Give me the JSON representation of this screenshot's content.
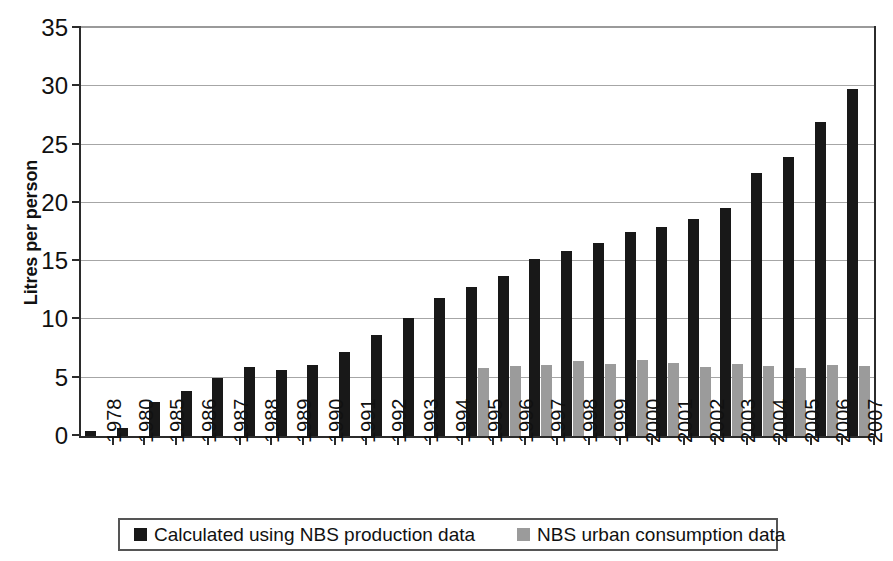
{
  "chart_data": {
    "type": "bar",
    "title": "",
    "xlabel": "",
    "ylabel": "Litres per person",
    "ylim": [
      0,
      35
    ],
    "ytick_values": [
      0,
      5,
      10,
      15,
      20,
      25,
      30,
      35
    ],
    "ytick_labels": [
      "0",
      "5",
      "10",
      "15",
      "20",
      "25",
      "30",
      "35"
    ],
    "grid": true,
    "legend_position": "bottom",
    "categories": [
      "1978",
      "1980",
      "1985",
      "1986",
      "1987",
      "1988",
      "1989",
      "1990",
      "1991",
      "1992",
      "1993",
      "1994",
      "1995",
      "1996",
      "1997",
      "1998",
      "1999",
      "2000",
      "2001",
      "2002",
      "2003",
      "2004",
      "2005",
      "2006",
      "2007"
    ],
    "series": [
      {
        "name": "Calculated using NBS production data",
        "color": "#181818",
        "values": [
          0.4,
          0.7,
          2.9,
          3.9,
          5.0,
          5.9,
          5.7,
          6.1,
          7.2,
          8.7,
          10.1,
          11.8,
          12.8,
          13.7,
          15.2,
          15.9,
          16.6,
          17.5,
          17.9,
          18.6,
          19.6,
          22.6,
          23.9,
          26.9,
          29.8
        ]
      },
      {
        "name": "NBS urban consumption data",
        "color": "#9b9b9b",
        "values": [
          null,
          null,
          null,
          null,
          null,
          null,
          null,
          null,
          null,
          null,
          null,
          null,
          5.8,
          6.0,
          6.1,
          6.4,
          6.2,
          6.5,
          6.3,
          5.9,
          6.2,
          6.0,
          5.8,
          6.1,
          6.0
        ]
      }
    ]
  },
  "legend": {
    "items": [
      {
        "label": "Calculated using NBS production data",
        "color": "#181818"
      },
      {
        "label": "NBS urban consumption data",
        "color": "#9b9b9b"
      }
    ]
  }
}
